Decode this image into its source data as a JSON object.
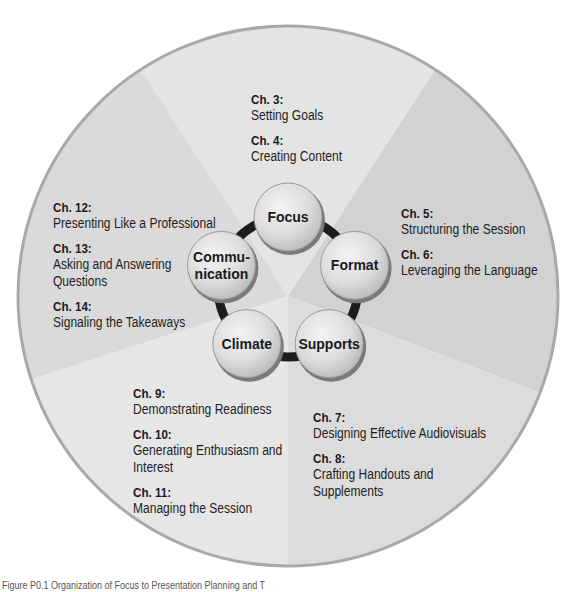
{
  "nodes": [
    {
      "label_lines": [
        "Focus"
      ],
      "key": "focus"
    },
    {
      "label_lines": [
        "Format"
      ],
      "key": "format"
    },
    {
      "label_lines": [
        "Supports"
      ],
      "key": "supports"
    },
    {
      "label_lines": [
        "Climate"
      ],
      "key": "climate"
    },
    {
      "label_lines": [
        "Commu-",
        "nication"
      ],
      "key": "communication"
    }
  ],
  "segments": [
    {
      "key": "focus",
      "color": "#e4e4e4",
      "chapters": [
        {
          "number": "Ch. 3:",
          "title_lines": [
            "Setting Goals"
          ]
        },
        {
          "number": "Ch. 4:",
          "title_lines": [
            "Creating Content"
          ]
        }
      ]
    },
    {
      "key": "format",
      "color": "#d2d2d2",
      "chapters": [
        {
          "number": "Ch. 5:",
          "title_lines": [
            "Structuring the Session"
          ]
        },
        {
          "number": "Ch. 6:",
          "title_lines": [
            "Leveraging the Language"
          ]
        }
      ]
    },
    {
      "key": "supports",
      "color": "#dcdcdc",
      "chapters": [
        {
          "number": "Ch. 7:",
          "title_lines": [
            "Designing Effective Audiovisuals"
          ]
        },
        {
          "number": "Ch. 8:",
          "title_lines": [
            "Crafting Handouts and",
            "Supplements"
          ]
        }
      ]
    },
    {
      "key": "climate",
      "color": "#e6e6e6",
      "chapters": [
        {
          "number": "Ch. 9:",
          "title_lines": [
            "Demonstrating Readiness"
          ]
        },
        {
          "number": "Ch. 10:",
          "title_lines": [
            "Generating Enthusiasm and",
            "Interest"
          ]
        },
        {
          "number": "Ch. 11:",
          "title_lines": [
            "Managing the Session"
          ]
        }
      ]
    },
    {
      "key": "communication",
      "color": "#dadada",
      "chapters": [
        {
          "number": "Ch. 12:",
          "title_lines": [
            "Presenting Like a Professional"
          ]
        },
        {
          "number": "Ch. 13:",
          "title_lines": [
            "Asking and Answering",
            "Questions"
          ]
        },
        {
          "number": "Ch. 14:",
          "title_lines": [
            "Signaling the Takeaways"
          ]
        }
      ]
    }
  ],
  "caption": "Figure P0.1 Organization of Focus to Presentation Planning and T"
}
